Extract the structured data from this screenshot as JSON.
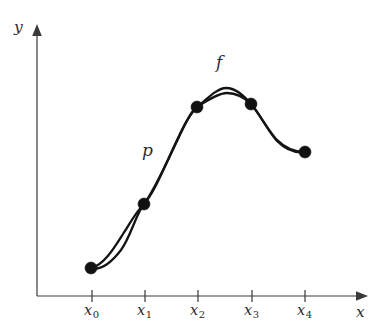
{
  "figure": {
    "background_color": "#ffffff",
    "curve_color": "#141414",
    "axis_color": "#3a3a3a",
    "node_color": "#111111",
    "width": 384,
    "height": 333
  },
  "axes": {
    "origin": {
      "x": 37,
      "y": 296
    },
    "x_axis": {
      "label": "x",
      "label_pos": {
        "x": 356,
        "y": 307
      },
      "start": {
        "x": 37,
        "y": 296
      },
      "end": {
        "x": 366,
        "y": 296
      },
      "arrow": true
    },
    "y_axis": {
      "label": "y",
      "label_pos": {
        "x": 14,
        "y": 20
      },
      "start": {
        "x": 37,
        "y": 296
      },
      "end": {
        "x": 37,
        "y": 28
      },
      "arrow": true
    }
  },
  "ticks": [
    {
      "label": "x",
      "sub": "0",
      "x": 92,
      "label_x": 84,
      "label_y": 303
    },
    {
      "label": "x",
      "sub": "1",
      "x": 145,
      "label_x": 137,
      "label_y": 303
    },
    {
      "label": "x",
      "sub": "2",
      "x": 198,
      "label_x": 190,
      "label_y": 303
    },
    {
      "label": "x",
      "sub": "3",
      "x": 252,
      "label_x": 244,
      "label_y": 303
    },
    {
      "label": "x",
      "sub": "4",
      "x": 305,
      "label_x": 297,
      "label_y": 303
    }
  ],
  "curve_labels": [
    {
      "name": "f",
      "text": "f",
      "x": 216,
      "y": 54
    },
    {
      "name": "p",
      "text": "p",
      "x": 142,
      "y": 142
    }
  ],
  "chart_data": {
    "type": "line",
    "xlabel": "x",
    "ylabel": "y",
    "grid": false,
    "legend": "inline-curve-labels",
    "xlim": [
      37,
      366
    ],
    "ylim": [
      296,
      28
    ],
    "node_labels": [
      "x0",
      "x1",
      "x2",
      "x3",
      "x4"
    ],
    "nodes": [
      {
        "label": "x0",
        "x": 91,
        "y": 268
      },
      {
        "label": "x1",
        "x": 144,
        "y": 204
      },
      {
        "label": "x2",
        "x": 197,
        "y": 107
      },
      {
        "label": "x3",
        "x": 251,
        "y": 104
      },
      {
        "label": "x4",
        "x": 305,
        "y": 152
      }
    ],
    "node_radius": 6,
    "series": [
      {
        "name": "f",
        "description": "Smooth underlying function passing through all five nodes",
        "path": "M 91 268 C 104 265, 114 248, 123 234 C 132 220, 136 212, 144 204 C 155 192, 166 163, 178 138 C 186 121, 191 112, 197 107 C 209 97, 218 88, 226 88 C 236 88, 244 96, 251 104 C 259 113, 266 127, 276 139 C 287 150, 298 152, 305 152"
      },
      {
        "name": "p",
        "description": "Interpolating polynomial agreeing with f at the five nodes",
        "path": "M 91 268 C 101 271, 111 263, 121 250 C 131 236, 136 214, 144 204 C 154 191, 167 162, 178 139 C 186 122, 191 112, 197 107 C 209 99, 219 93, 227 93 C 236 93, 244 97, 251 104 C 260 114, 267 130, 277 141 C 288 152, 298 153, 305 152"
      }
    ]
  }
}
